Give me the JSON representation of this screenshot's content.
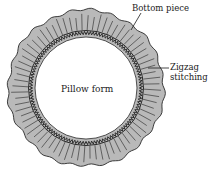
{
  "diagram": {
    "labels": {
      "bottom_piece": "Bottom piece",
      "zigzag_line1": "Zigzag",
      "zigzag_line2": "stitching",
      "pillow_form": "Pillow form"
    },
    "ring": {
      "cx": 86,
      "cy": 88,
      "outer_r": 78,
      "inner_r": 52,
      "fill": "#b9b9b9",
      "stroke": "#2a2a2a",
      "pleat_count": 72
    },
    "colors": {
      "background": "#ffffff",
      "ring_fill": "#b9b9b9",
      "line": "#2a2a2a",
      "text": "#1a1a1a"
    }
  }
}
